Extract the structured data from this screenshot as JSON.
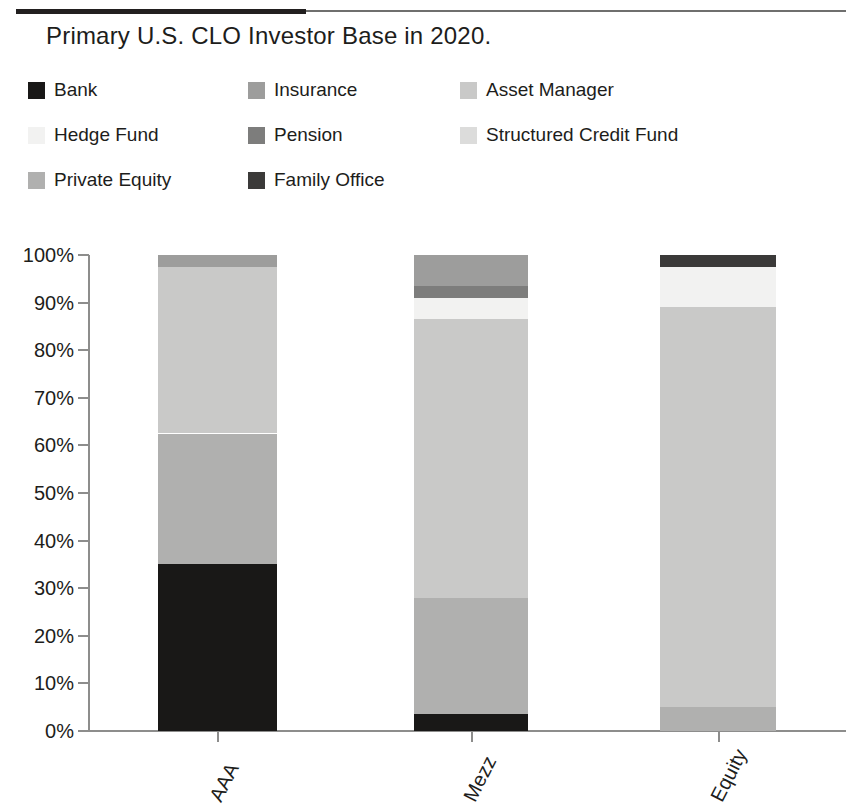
{
  "title": "Primary U.S. CLO Investor Base in 2020.",
  "legend": {
    "rows": [
      [
        {
          "label": "Bank",
          "color": "#191817"
        },
        {
          "label": "Insurance",
          "color": "#9d9d9c"
        },
        {
          "label": "Asset Manager",
          "color": "#c9c9c8"
        }
      ],
      [
        {
          "label": "Hedge Fund",
          "color": "#f2f2f1"
        },
        {
          "label": "Pension",
          "color": "#7d7d7c"
        },
        {
          "label": "Structured Credit Fund",
          "color": "#dcdcdb"
        }
      ],
      [
        {
          "label": "Private Equity",
          "color": "#b0b0af"
        },
        {
          "label": "Family Office",
          "color": "#3b3a39"
        }
      ]
    ]
  },
  "chart_data": {
    "type": "bar",
    "subtype": "stacked-bar-100-percent",
    "title": "Primary U.S. CLO Investor Base in 2020.",
    "xlabel": "",
    "ylabel": "",
    "ylim": [
      0,
      100
    ],
    "yticks": [
      "0%",
      "10%",
      "20%",
      "30%",
      "40%",
      "50%",
      "60%",
      "70%",
      "80%",
      "90%",
      "100%"
    ],
    "ytick_values": [
      0,
      10,
      20,
      30,
      40,
      50,
      60,
      70,
      80,
      90,
      100
    ],
    "grid": false,
    "legend_position": "top",
    "units": "percent",
    "categories": [
      "AAA",
      "Mezz",
      "Equity"
    ],
    "series": [
      {
        "name": "Bank",
        "color": "#191817",
        "values": [
          35.0,
          3.5,
          0.0
        ]
      },
      {
        "name": "Private Equity",
        "color": "#b0b0af",
        "values": [
          27.5,
          24.5,
          5.0
        ]
      },
      {
        "name": "Asset Manager",
        "color": "#c9c9c8",
        "values": [
          35.0,
          58.5,
          84.0
        ]
      },
      {
        "name": "Hedge Fund",
        "color": "#f2f2f1",
        "values": [
          0.0,
          4.5,
          8.5
        ]
      },
      {
        "name": "Structured Credit Fund",
        "color": "#dcdcdb",
        "values": [
          0.0,
          0.0,
          0.0
        ]
      },
      {
        "name": "Pension",
        "color": "#7d7d7c",
        "values": [
          0.0,
          2.5,
          0.0
        ]
      },
      {
        "name": "Insurance",
        "color": "#9d9d9c",
        "values": [
          2.5,
          6.5,
          0.0
        ]
      },
      {
        "name": "Family Office",
        "color": "#3b3a39",
        "values": [
          0.0,
          0.0,
          2.5
        ]
      }
    ]
  },
  "geometry": {
    "plot_top_px": 255,
    "plot_bottom_px": 731,
    "bars": [
      {
        "category": "AAA",
        "left_px": 158,
        "width_px": 119,
        "tick_px": 217
      },
      {
        "category": "Mezz",
        "left_px": 414,
        "width_px": 114,
        "tick_px": 471
      },
      {
        "category": "Equity",
        "left_px": 660,
        "width_px": 116,
        "tick_px": 718
      }
    ]
  }
}
